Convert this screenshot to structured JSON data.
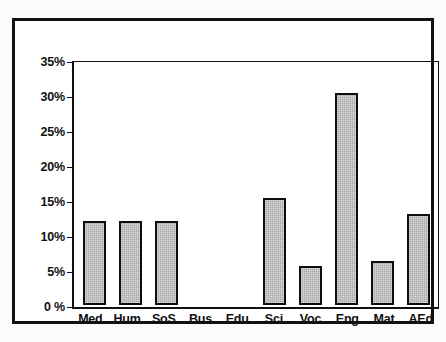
{
  "chart_data": {
    "type": "bar",
    "title": "",
    "subtitle": "",
    "xlabel": "",
    "ylabel": "",
    "categories": [
      "Med",
      "Hum",
      "SoS",
      "Bus",
      "Edu",
      "Sci",
      "Voc",
      "Eng",
      "Mat",
      "AEd"
    ],
    "values": [
      12.0,
      12.0,
      12.0,
      0,
      0,
      15.4,
      5.5,
      30.6,
      6.3,
      13.1
    ],
    "ylim": [
      0,
      35
    ],
    "ytick_values": [
      35,
      30,
      25,
      20,
      15,
      10,
      5,
      0
    ],
    "ytick_labels": [
      "35%",
      "30%",
      "25%",
      "20%",
      "15%",
      "10%",
      "5%",
      "0 %"
    ],
    "grid": false,
    "legend": null,
    "annotations": [],
    "bar_fill_color": "#a8a8a8",
    "bar_edge_color": "#0d0d0d",
    "axis_color": "#111111",
    "background_color": "#ffffff"
  }
}
